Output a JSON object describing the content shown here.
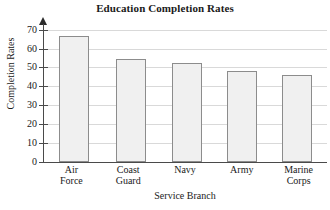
{
  "chart_data": {
    "type": "bar",
    "title": "Education Completion Rates",
    "xlabel": "Service Branch",
    "ylabel": "Completion Rates",
    "categories": [
      "Air Force",
      "Coast Guard",
      "Navy",
      "Army",
      "Marine Corps"
    ],
    "category_lines": [
      [
        "Air",
        "Force"
      ],
      [
        "Coast",
        "Guard"
      ],
      [
        "Navy",
        ""
      ],
      [
        "Army",
        ""
      ],
      [
        "Marine",
        "Corps"
      ]
    ],
    "values": [
      66.5,
      54.5,
      52.5,
      48,
      46
    ],
    "ylim": [
      0,
      73
    ],
    "yticks": [
      0,
      10,
      20,
      30,
      40,
      50,
      60,
      70
    ],
    "ytick_labels": [
      "0",
      "10",
      "20",
      "30",
      "40",
      "50",
      "60",
      "70"
    ],
    "grid": true,
    "legend": false,
    "bar_fill": "#f0f0f0",
    "bar_border": "#8c8c8c",
    "grid_color": "#d9d9d9",
    "axis_color": "#4a4a4a"
  }
}
